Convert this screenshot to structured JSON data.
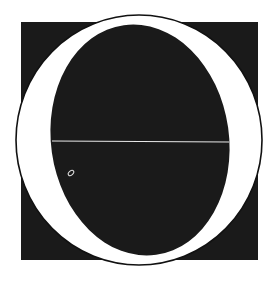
{
  "figure": {
    "type": "decorative-initial-letter",
    "letter": "O",
    "colors": {
      "background": "#ffffff",
      "square": "#1a1a1a",
      "ring": "#ffffff",
      "counter": "#1a1a1a",
      "outline": "#111111",
      "hairline": "#e8e8e8"
    }
  }
}
